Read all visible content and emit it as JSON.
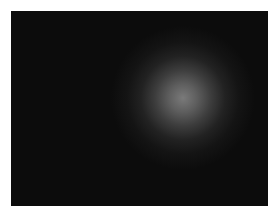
{
  "image": {
    "description": "Dark photograph with a soft, out-of-focus gray circular glow right of center",
    "background_color": "#0c0c0c",
    "border_color": "#ffffff",
    "glow": {
      "center": [
        183,
        98
      ],
      "radius_px": 45,
      "peak_color": "#7a7a7a"
    }
  }
}
